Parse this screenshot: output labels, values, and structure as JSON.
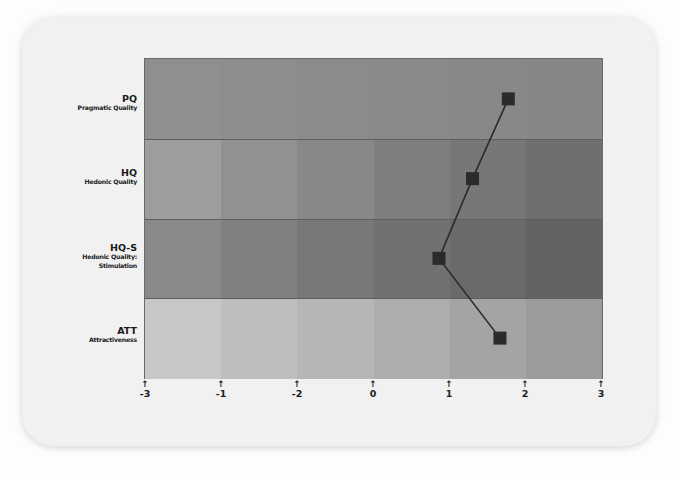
{
  "chart_data": {
    "type": "line",
    "title": "",
    "xlabel": "",
    "ylabel": "",
    "orientation": "horizontal-profile",
    "categories": [
      "PQ",
      "HQ",
      "HQ-S",
      "ATT"
    ],
    "category_descriptions": [
      "Pragmatic Quality",
      "Hedonic Quality",
      "Hedonic Quality: Stimulation",
      "Attractiveness"
    ],
    "values": [
      1.77,
      1.3,
      0.86,
      1.66
    ],
    "x_ticks": [
      -3,
      -2,
      -1,
      0,
      1,
      2,
      3
    ],
    "x_tick_labels_as_displayed": [
      "-3",
      "-1",
      "-2",
      "0",
      "1",
      "2",
      "3"
    ],
    "xlim": [
      -3,
      3
    ],
    "grid": false,
    "legend": null,
    "marker": "square",
    "background_bands": {
      "rows": 4,
      "columns": 6,
      "colors": [
        [
          "#8f8f8f",
          "#8d8d8d",
          "#8b8b8b",
          "#8a8a8a",
          "#888888",
          "#868686"
        ],
        [
          "#9d9d9d",
          "#919191",
          "#888888",
          "#7f7f7f",
          "#777777",
          "#6f6f6f"
        ],
        [
          "#898989",
          "#808080",
          "#787878",
          "#717171",
          "#6a6a6a",
          "#636363"
        ],
        [
          "#c7c7c7",
          "#bebebe",
          "#b6b6b6",
          "#adadad",
          "#a4a4a4",
          "#9b9b9b"
        ]
      ]
    }
  },
  "rows": [
    {
      "abbr": "PQ",
      "lines": [
        "Pragmatic Quality"
      ]
    },
    {
      "abbr": "HQ",
      "lines": [
        "Hedonic Quality"
      ]
    },
    {
      "abbr": "HQ-S",
      "lines": [
        "Hedonic Quality:",
        "Stimulation"
      ]
    },
    {
      "abbr": "ATT",
      "lines": [
        "Attractiveness"
      ]
    }
  ],
  "ticks": [
    "-3",
    "-1",
    "-2",
    "0",
    "1",
    "2",
    "3"
  ],
  "tick_arrow": "↑",
  "colors": {
    "marker": "#2b2b2b",
    "line": "#2b2b2b",
    "card": "#f1f1f1",
    "label_text": "#1a1a1a"
  }
}
